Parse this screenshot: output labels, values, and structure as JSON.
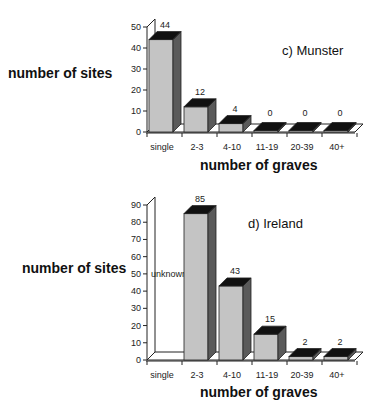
{
  "chart_data": [
    {
      "type": "bar",
      "title": "c) Munster",
      "xlabel": "number of graves",
      "ylabel": "number of sites",
      "categories": [
        "single",
        "2-3",
        "4-10",
        "11-19",
        "20-39",
        "40+"
      ],
      "values": [
        44,
        12,
        4,
        0,
        0,
        0
      ],
      "value_labels": [
        "44",
        "12",
        "4",
        "0",
        "0",
        "0"
      ],
      "yticks": [
        0,
        10,
        20,
        30,
        40,
        50
      ],
      "ylim": [
        0,
        50
      ],
      "grid": false,
      "style": "3d"
    },
    {
      "type": "bar",
      "title": "d) Ireland",
      "xlabel": "number of graves",
      "ylabel": "number of sites",
      "categories": [
        "single",
        "2-3",
        "4-10",
        "11-19",
        "20-39",
        "40+"
      ],
      "values": [
        null,
        85,
        43,
        15,
        2,
        2
      ],
      "value_labels": [
        "unknown",
        "85",
        "43",
        "15",
        "2",
        "2"
      ],
      "yticks": [
        0,
        10,
        20,
        30,
        40,
        50,
        60,
        70,
        80,
        90
      ],
      "ylim": [
        0,
        90
      ],
      "grid": false,
      "style": "3d",
      "annotations": [
        "unknown"
      ]
    }
  ],
  "colors": {
    "bar_front": "#c4c4c4",
    "bar_side": "#5a5a5a",
    "bar_top": "#111111",
    "axis": "#222222"
  }
}
